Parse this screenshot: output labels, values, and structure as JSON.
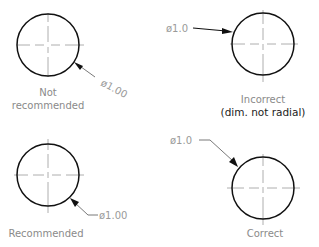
{
  "diagram": {
    "panels": [
      {
        "id": "top-left",
        "dimension_text": "ø1.00",
        "caption_lines": [
          "Not",
          "recommended"
        ],
        "note": "leader text aligned with leader"
      },
      {
        "id": "top-right",
        "dimension_text": "ø1.0",
        "caption_lines": [
          "Incorrect",
          "(dim. not radial)"
        ],
        "note": "horizontal leader not radial"
      },
      {
        "id": "bottom-left",
        "dimension_text": "ø1.00",
        "caption_lines": [
          "Recommended"
        ],
        "note": "radial leader with horizontal shoulder, text horizontal"
      },
      {
        "id": "bottom-right",
        "dimension_text": "ø1.0",
        "caption_lines": [
          "Correct"
        ],
        "note": "radial leader with shoulder"
      }
    ],
    "colors": {
      "circle": "#111111",
      "centerline": "#9a9a9a",
      "text": "#8a8a8a",
      "bold_text": "#222222"
    }
  }
}
